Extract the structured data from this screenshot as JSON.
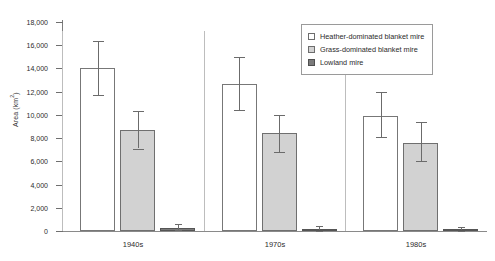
{
  "chart_data": {
    "type": "bar",
    "title": "",
    "xlabel": "",
    "ylabel": "Area (km2)",
    "ylabel_base": "Area (km",
    "ylabel_sup": "2",
    "ylabel_tail": ")",
    "categories": [
      "1940s",
      "1970s",
      "1980s"
    ],
    "ylim": [
      0,
      18000
    ],
    "ytick_values": [
      0,
      2000,
      4000,
      6000,
      8000,
      10000,
      12000,
      14000,
      16000,
      18000
    ],
    "ytick_labels": [
      "0",
      "2,000",
      "4,000",
      "6,000",
      "8,000",
      "10,000",
      "12,000",
      "14,000",
      "16,000",
      "18,000"
    ],
    "grid": false,
    "legend_position": "top-right",
    "error_bars": true,
    "series": [
      {
        "name": "Heather-dominated blanket mire",
        "key": "heather",
        "color": "#ffffff",
        "edge_color": "#777777",
        "values": [
          14000,
          12700,
          9900
        ],
        "err_low": [
          11700,
          10400,
          8100
        ],
        "err_high": [
          16400,
          15000,
          12000
        ]
      },
      {
        "name": "Grass-dominated blanket mire",
        "key": "grass",
        "color": "#d2d2d2",
        "edge_color": "#6f6f6f",
        "values": [
          8700,
          8450,
          7600
        ],
        "err_low": [
          7100,
          6800,
          6000
        ],
        "err_high": [
          10300,
          10000,
          9400
        ]
      },
      {
        "name": "Lowland mire",
        "key": "lowland",
        "color": "#7b7b7b",
        "edge_color": "#555555",
        "values": [
          250,
          180,
          130
        ],
        "err_low": [
          60,
          40,
          30
        ],
        "err_high": [
          600,
          420,
          330
        ]
      }
    ]
  }
}
